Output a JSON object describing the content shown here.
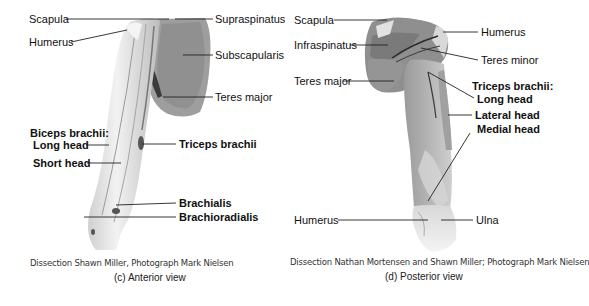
{
  "panels": {
    "anterior": {
      "caption": "(c) Anterior view",
      "credit": "Dissection Shawn Miller, Photograph Mark Nielsen",
      "labels": {
        "scapula": "Scapula",
        "humerus": "Humerus",
        "supraspinatus": "Supraspinatus",
        "subscapularis": "Subscapularis",
        "teres_major": "Teres major",
        "biceps_title": "Biceps brachii:",
        "long_head": "Long head",
        "short_head": "Short head",
        "triceps_brachii": "Triceps brachii",
        "brachialis": "Brachialis",
        "brachioradialis": "Brachioradialis"
      }
    },
    "posterior": {
      "caption": "(d) Posterior view",
      "credit": "Dissection Nathan Mortensen and Shawn Miller; Photograph Mark Nielsen",
      "labels": {
        "scapula": "Scapula",
        "infraspinatus": "Infraspinatus",
        "teres_major": "Teres major",
        "humerus_top": "Humerus",
        "teres_minor": "Teres minor",
        "triceps_title": "Triceps brachii:",
        "long_head": "Long head",
        "lateral_head": "Lateral head",
        "medial_head": "Medial head",
        "humerus_bottom": "Humerus",
        "ulna": "Ulna"
      }
    }
  },
  "colors": {
    "muscle": "#8f8f8f",
    "muscle_dark": "#6e6e6e",
    "bone": "#e6e6e6",
    "leader_line": "#222222"
  }
}
